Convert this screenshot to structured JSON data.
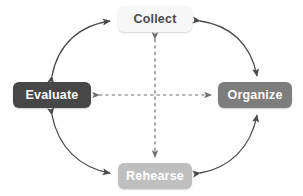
{
  "diagram": {
    "type": "cycle-diagram",
    "title": "",
    "background_color": "#ffffff",
    "nodes": [
      {
        "id": "collect",
        "label": "Collect",
        "position": "top",
        "fill_color": "#f7f7f7",
        "text_color": "#4a4a4a"
      },
      {
        "id": "organize",
        "label": "Organize",
        "position": "right",
        "fill_color": "#7d7d7d",
        "text_color": "#ffffff"
      },
      {
        "id": "rehearse",
        "label": "Rehearse",
        "position": "bottom",
        "fill_color": "#bfbfbf",
        "text_color": "#ffffff"
      },
      {
        "id": "evaluate",
        "label": "Evaluate",
        "position": "left",
        "fill_color": "#474747",
        "text_color": "#ffffff"
      }
    ],
    "connectors": [
      {
        "id": "arc-collect-evaluate",
        "from": "collect",
        "to": "evaluate",
        "style": "solid-curve",
        "direction": "bidirectional",
        "color": "#4a4a4a"
      },
      {
        "id": "arc-collect-organize",
        "from": "collect",
        "to": "organize",
        "style": "solid-curve",
        "direction": "bidirectional",
        "color": "#4a4a4a"
      },
      {
        "id": "arc-evaluate-rehearse",
        "from": "evaluate",
        "to": "rehearse",
        "style": "solid-curve",
        "direction": "bidirectional",
        "color": "#4a4a4a"
      },
      {
        "id": "arc-rehearse-organize",
        "from": "rehearse",
        "to": "organize",
        "style": "solid-curve",
        "direction": "bidirectional",
        "color": "#4a4a4a"
      },
      {
        "id": "dashed-evaluate-organize",
        "from": "evaluate",
        "to": "organize",
        "style": "dashed-straight",
        "direction": "bidirectional",
        "color": "#6e6e6e"
      },
      {
        "id": "dashed-collect-rehearse",
        "from": "collect",
        "to": "rehearse",
        "style": "dashed-straight",
        "direction": "bidirectional",
        "color": "#6e6e6e"
      }
    ]
  }
}
